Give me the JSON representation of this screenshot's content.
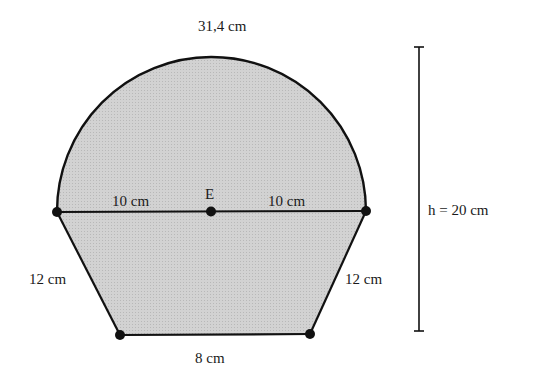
{
  "figure": {
    "type": "geometric-composite-shape",
    "colors": {
      "fill": "#cfcfcf",
      "stroke": "#111111",
      "background": "#ffffff"
    },
    "labels": {
      "arc_length": "31,4 cm",
      "center_point": "E",
      "left_radius": "10 cm",
      "right_radius": "10 cm",
      "left_leg": "12 cm",
      "right_leg": "12 cm",
      "bottom_base": "8 cm",
      "height": "h = 20 cm"
    },
    "measurements": {
      "arc_length_cm": 31.4,
      "radius_cm": 10,
      "diameter_cm": 20,
      "leg_cm": 12,
      "bottom_base_cm": 8,
      "total_height_cm": 20
    },
    "points": [
      {
        "name": "left-diameter-end"
      },
      {
        "name": "center-E"
      },
      {
        "name": "right-diameter-end"
      },
      {
        "name": "bottom-left-vertex"
      },
      {
        "name": "bottom-right-vertex"
      }
    ]
  }
}
